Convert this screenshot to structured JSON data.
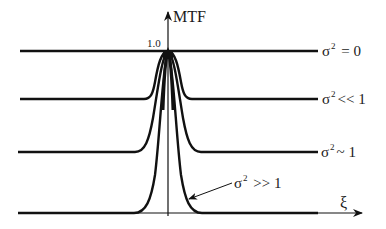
{
  "figure": {
    "y_axis_label": "MTF",
    "y_tick_label": "1.0",
    "x_axis_label": "ξ",
    "curves": [
      {
        "id": "sigma0",
        "symbol": "σ",
        "exponent": "2",
        "relation": " = 0"
      },
      {
        "id": "sigma_small",
        "symbol": "σ",
        "exponent": "2",
        "relation": "<< 1"
      },
      {
        "id": "sigma_one",
        "symbol": "σ",
        "exponent": "2",
        "relation": "~ 1"
      },
      {
        "id": "sigma_large",
        "symbol": "σ",
        "exponent": "2",
        "relation": " >> 1"
      }
    ]
  },
  "colors": {
    "line": "#111111",
    "background": "#ffffff"
  }
}
